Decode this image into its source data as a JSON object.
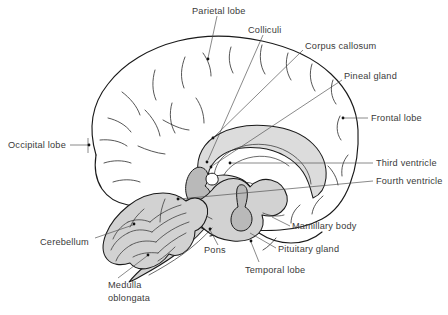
{
  "figure": {
    "type": "anatomical-line-diagram",
    "background_color": "#ffffff",
    "ink_color": "#1a1a1a",
    "label_color": "#3a3a3a",
    "shading_color": "#dcdcdc",
    "dark_shading_color": "#b9b9b9"
  },
  "labels": {
    "parietal_lobe": "Parietal lobe",
    "colliculi": "Colliculi",
    "corpus_callosum": "Corpus callosum",
    "pineal_gland": "Pineal gland",
    "frontal_lobe": "Frontal lobe",
    "third_ventricle": "Third ventricle",
    "fourth_ventricle": "Fourth ventricle",
    "mamillary_body": "Mamillary body",
    "pituitary_gland": "Pituitary gland",
    "temporal_lobe": "Temporal lobe",
    "pons": "Pons",
    "medulla_line1": "Medulla",
    "medulla_line2": "oblongata",
    "cerebellum": "Cerebellum",
    "occipital_lobe": "Occipital lobe"
  }
}
